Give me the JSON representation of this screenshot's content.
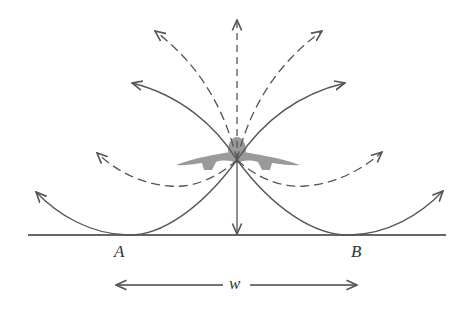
{
  "diagram": {
    "labels": {
      "a": "A",
      "b": "B",
      "v": "V",
      "w": "w"
    },
    "colors": {
      "stroke": "#555555",
      "figure": "#9a9a9a",
      "ground": "#333333"
    },
    "curves": [
      {
        "id": "left-outer",
        "style": "solid"
      },
      {
        "id": "left-low",
        "style": "dashed"
      },
      {
        "id": "left-mid",
        "style": "solid"
      },
      {
        "id": "left-high",
        "style": "dashed"
      },
      {
        "id": "vertical-up",
        "style": "dashed"
      },
      {
        "id": "vertical-down",
        "style": "solid"
      },
      {
        "id": "right-high",
        "style": "dashed"
      },
      {
        "id": "right-mid",
        "style": "solid"
      },
      {
        "id": "right-low",
        "style": "dashed"
      },
      {
        "id": "right-outer",
        "style": "solid"
      }
    ]
  }
}
